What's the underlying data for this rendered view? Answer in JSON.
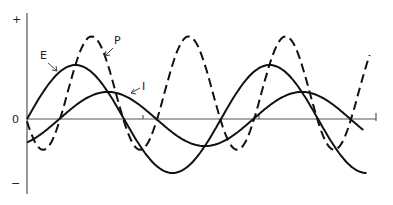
{
  "chart_data": {
    "type": "line",
    "title": "",
    "xlabel": "",
    "ylabel": "",
    "y_tick_labels": [
      "+",
      "0",
      "−"
    ],
    "grid": false,
    "legend": "inline labels with arrows",
    "x_range_deg": [
      0,
      630
    ],
    "series": [
      {
        "name": "E",
        "style": "solid",
        "description": "voltage sine wave",
        "amplitude": 1.0,
        "phase_deg": 0
      },
      {
        "name": "I",
        "style": "solid",
        "description": "current sine wave, smaller, lagging E",
        "amplitude": 0.5,
        "phase_deg": -60
      },
      {
        "name": "P",
        "style": "dashed",
        "description": "instantaneous power = E x I, double frequency, offset above zero",
        "amplitude": 1.05,
        "offset": 0.48
      }
    ],
    "sample_points": {
      "x_deg": [
        0,
        90,
        180,
        270,
        360,
        450,
        540,
        630
      ],
      "E": [
        0,
        1,
        0,
        -1,
        0,
        1,
        0,
        -1
      ],
      "I": [
        -0.43,
        0.25,
        0.43,
        -0.25,
        -0.43,
        0.25,
        0.43,
        -0.25
      ]
    }
  },
  "labels": {
    "plus": "+",
    "zero": "0",
    "minus": "−",
    "E": "E",
    "P": "P",
    "I": "I"
  }
}
